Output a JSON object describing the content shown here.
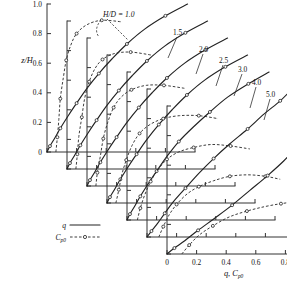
{
  "figure": {
    "name": "staggered-profile-chart",
    "y_axis_title": "z/H",
    "x_axis_title_main": "q",
    "x_axis_title_sep": ",",
    "x_axis_title_second": "C",
    "x_axis_title_second_sub": "p0",
    "series_note_label": "H/D = 1.0"
  },
  "legend": {
    "q_label": "q",
    "cp_label": "C",
    "cp_label_sub": "p0"
  },
  "axes": {
    "y_ticks": [
      "1.0",
      "0.8",
      "0.6",
      "0.4",
      "0.2",
      "0"
    ],
    "y_tick_values": [
      1.0,
      0.8,
      0.6,
      0.4,
      0.2,
      0.0
    ],
    "x_ticks": [
      "0",
      "0.2",
      "0.4",
      "0.6",
      "0.8",
      "1.0"
    ],
    "x_tick_values": [
      0.0,
      0.2,
      0.4,
      0.6,
      0.8,
      1.0
    ],
    "ylim": [
      0,
      1.0
    ],
    "xlim": [
      0,
      1.0
    ]
  },
  "panel_labels": [
    "H/D = 1.0",
    "1.5",
    "2.0",
    "2.5",
    "3.0",
    "4.0",
    "5.0"
  ],
  "chart_data": {
    "type": "line",
    "title": "",
    "subtitle": "",
    "xlabel": "q , Cp0",
    "ylabel": "z/H",
    "xlim": [
      0,
      1.0
    ],
    "ylim": [
      0,
      1.0
    ],
    "grid": false,
    "legend_position": "lower-left",
    "x_tick_labels": [
      "0",
      "0.2",
      "0.4",
      "0.6",
      "0.8",
      "1.0"
    ],
    "y_tick_labels": [
      "1.0",
      "0.8",
      "0.6",
      "0.4",
      "0.2",
      "0"
    ],
    "layout": "staggered offset panels, one per H/D ratio, each shifted right and down",
    "panels": [
      {
        "name": "H/D = 1.0",
        "hd": 1.0,
        "label": "H/D = 1.0",
        "series": [
          {
            "name": "q",
            "style": "solid",
            "x": [
              0.0,
              0.02,
              0.05,
              0.09,
              0.14,
              0.2,
              0.27,
              0.35,
              0.44,
              0.54,
              0.66,
              0.8,
              0.95
            ],
            "y": [
              0.0,
              0.04,
              0.09,
              0.16,
              0.24,
              0.33,
              0.43,
              0.53,
              0.63,
              0.73,
              0.83,
              0.92,
              1.0
            ]
          },
          {
            "name": "Cp0",
            "style": "dashed",
            "x": [
              0.06,
              0.07,
              0.08,
              0.09,
              0.11,
              0.13,
              0.16,
              0.2,
              0.27,
              0.37,
              0.5
            ],
            "y": [
              0.0,
              0.1,
              0.22,
              0.36,
              0.5,
              0.62,
              0.72,
              0.8,
              0.86,
              0.89,
              0.88
            ]
          }
        ]
      },
      {
        "name": "H/D = 1.5",
        "hd": 1.5,
        "label": "1.5",
        "series": [
          {
            "name": "q",
            "style": "solid",
            "x": [
              0.0,
              0.02,
              0.05,
              0.09,
              0.14,
              0.2,
              0.27,
              0.35,
              0.44,
              0.54,
              0.66,
              0.8,
              0.95
            ],
            "y": [
              0.0,
              0.04,
              0.09,
              0.16,
              0.24,
              0.33,
              0.43,
              0.53,
              0.63,
              0.73,
              0.83,
              0.92,
              1.0
            ]
          },
          {
            "name": "Cp0",
            "style": "dashed",
            "x": [
              0.06,
              0.07,
              0.08,
              0.1,
              0.12,
              0.15,
              0.19,
              0.24,
              0.32,
              0.43,
              0.57
            ],
            "y": [
              0.0,
              0.1,
              0.22,
              0.35,
              0.48,
              0.59,
              0.68,
              0.74,
              0.78,
              0.79,
              0.77
            ]
          }
        ]
      },
      {
        "name": "H/D = 2.0",
        "hd": 2.0,
        "label": "2.0",
        "series": [
          {
            "name": "q",
            "style": "solid",
            "x": [
              0.0,
              0.02,
              0.05,
              0.09,
              0.14,
              0.2,
              0.27,
              0.35,
              0.44,
              0.54,
              0.66,
              0.8,
              0.95
            ],
            "y": [
              0.0,
              0.04,
              0.09,
              0.16,
              0.24,
              0.33,
              0.43,
              0.53,
              0.63,
              0.73,
              0.83,
              0.92,
              1.0
            ]
          },
          {
            "name": "Cp0",
            "style": "dashed",
            "x": [
              0.06,
              0.07,
              0.09,
              0.11,
              0.14,
              0.18,
              0.23,
              0.3,
              0.4,
              0.52,
              0.66
            ],
            "y": [
              0.0,
              0.09,
              0.2,
              0.32,
              0.43,
              0.53,
              0.6,
              0.65,
              0.68,
              0.68,
              0.66
            ]
          }
        ]
      },
      {
        "name": "H/D = 2.5",
        "hd": 2.5,
        "label": "2.5",
        "series": [
          {
            "name": "q",
            "style": "solid",
            "x": [
              0.0,
              0.02,
              0.05,
              0.09,
              0.14,
              0.2,
              0.27,
              0.35,
              0.44,
              0.54,
              0.66,
              0.8,
              0.95
            ],
            "y": [
              0.0,
              0.04,
              0.09,
              0.16,
              0.24,
              0.33,
              0.43,
              0.53,
              0.63,
              0.73,
              0.83,
              0.92,
              1.0
            ]
          },
          {
            "name": "Cp0",
            "style": "dashed",
            "x": [
              0.06,
              0.08,
              0.1,
              0.13,
              0.17,
              0.22,
              0.29,
              0.38,
              0.49,
              0.62,
              0.75
            ],
            "y": [
              0.0,
              0.09,
              0.19,
              0.29,
              0.39,
              0.47,
              0.53,
              0.57,
              0.59,
              0.59,
              0.57
            ]
          }
        ]
      },
      {
        "name": "H/D = 3.0",
        "hd": 3.0,
        "label": "3.0",
        "series": [
          {
            "name": "q",
            "style": "solid",
            "x": [
              0.0,
              0.02,
              0.05,
              0.09,
              0.14,
              0.2,
              0.27,
              0.35,
              0.45,
              0.56,
              0.68,
              0.82,
              0.96
            ],
            "y": [
              0.0,
              0.04,
              0.09,
              0.16,
              0.24,
              0.33,
              0.43,
              0.53,
              0.63,
              0.73,
              0.83,
              0.92,
              1.0
            ]
          },
          {
            "name": "Cp0",
            "style": "dashed",
            "x": [
              0.07,
              0.09,
              0.12,
              0.16,
              0.21,
              0.27,
              0.35,
              0.45,
              0.57,
              0.7,
              0.83
            ],
            "y": [
              0.0,
              0.08,
              0.17,
              0.26,
              0.34,
              0.41,
              0.46,
              0.49,
              0.51,
              0.5,
              0.48
            ]
          }
        ]
      },
      {
        "name": "H/D = 4.0",
        "hd": 4.0,
        "label": "4.0",
        "series": [
          {
            "name": "q",
            "style": "solid",
            "x": [
              0.0,
              0.03,
              0.07,
              0.12,
              0.18,
              0.26,
              0.35,
              0.45,
              0.56,
              0.68,
              0.79,
              0.9,
              0.98
            ],
            "y": [
              0.0,
              0.04,
              0.09,
              0.16,
              0.24,
              0.33,
              0.43,
              0.53,
              0.63,
              0.73,
              0.83,
              0.92,
              1.0
            ]
          },
          {
            "name": "Cp0",
            "style": "dashed",
            "x": [
              0.08,
              0.11,
              0.15,
              0.2,
              0.27,
              0.35,
              0.45,
              0.56,
              0.68,
              0.8,
              0.9
            ],
            "y": [
              0.0,
              0.07,
              0.15,
              0.22,
              0.29,
              0.34,
              0.38,
              0.41,
              0.42,
              0.41,
              0.39
            ]
          }
        ]
      },
      {
        "name": "H/D = 5.0",
        "hd": 5.0,
        "label": "5.0",
        "series": [
          {
            "name": "q",
            "style": "solid",
            "x": [
              0.0,
              0.05,
              0.12,
              0.21,
              0.32,
              0.44,
              0.56,
              0.68,
              0.79,
              0.88,
              0.94,
              0.98,
              1.0
            ],
            "y": [
              0.0,
              0.04,
              0.09,
              0.16,
              0.24,
              0.33,
              0.43,
              0.53,
              0.63,
              0.73,
              0.83,
              0.92,
              1.0
            ]
          },
          {
            "name": "Cp0",
            "style": "dashed",
            "x": [
              0.1,
              0.15,
              0.22,
              0.31,
              0.42,
              0.54,
              0.66,
              0.77,
              0.86,
              0.92,
              0.96
            ],
            "y": [
              0.0,
              0.06,
              0.13,
              0.19,
              0.25,
              0.29,
              0.32,
              0.34,
              0.35,
              0.34,
              0.32
            ]
          }
        ]
      }
    ]
  }
}
